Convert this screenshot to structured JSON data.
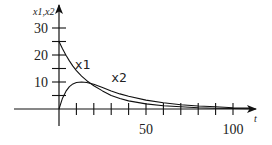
{
  "chart_data": {
    "type": "line",
    "title": "",
    "xlabel": "t",
    "ylabel": "x1,x2",
    "xlim": [
      0,
      100
    ],
    "ylim": [
      0,
      30
    ],
    "x_ticks": [
      10,
      20,
      30,
      40,
      50,
      60,
      70,
      80,
      90,
      100
    ],
    "x_tick_labels": [
      {
        "value": 50,
        "label": "50"
      },
      {
        "value": 100,
        "label": "100"
      }
    ],
    "y_ticks": [
      5,
      10,
      15,
      20,
      25,
      30
    ],
    "y_tick_labels": [
      {
        "value": 10,
        "label": "10"
      },
      {
        "value": 20,
        "label": "20"
      },
      {
        "value": 30,
        "label": "30"
      }
    ],
    "grid": false,
    "legend": "inline labels",
    "x": [
      0,
      2,
      4,
      6,
      8,
      10,
      13,
      16,
      20,
      25,
      30,
      35,
      40,
      50,
      60,
      70,
      80,
      90,
      100,
      110
    ],
    "series": [
      {
        "name": "x1",
        "label_pos": {
          "t": 9,
          "v": 15
        },
        "values": [
          25,
          22.3,
          19.9,
          17.8,
          15.9,
          14.2,
          12.2,
          10.5,
          8.6,
          6.7,
          5.0,
          3.9,
          3.0,
          1.9,
          1.2,
          0.8,
          0.5,
          0.3,
          0.2,
          0.1
        ]
      },
      {
        "name": "x2",
        "label_pos": {
          "t": 30,
          "v": 10
        },
        "values": [
          0,
          4.0,
          6.6,
          8.3,
          9.3,
          9.8,
          10.0,
          9.8,
          9.2,
          8.0,
          6.7,
          5.6,
          4.7,
          3.3,
          2.3,
          1.6,
          1.1,
          0.8,
          0.5,
          0.35
        ]
      }
    ]
  }
}
